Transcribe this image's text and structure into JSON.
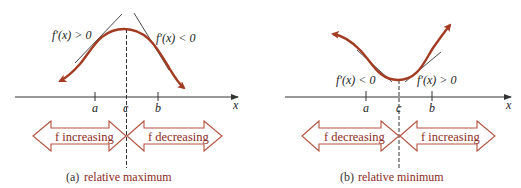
{
  "colors": {
    "curve": "#a33b22",
    "arrow_outline": "#b5523f",
    "text_accent": "#8b2a1e",
    "axis": "#333333",
    "tangent": "#333333"
  },
  "panels": [
    {
      "id": "a",
      "derivative_left": "f′(x) > 0",
      "derivative_right": "f′(x) < 0",
      "ticks": {
        "a": "a",
        "c": "c",
        "b": "b"
      },
      "axis_label": "x",
      "arrow_left": "f increasing",
      "arrow_right": "f decreasing",
      "caption_tag": "(a)",
      "caption_text": "relative maximum"
    },
    {
      "id": "b",
      "derivative_left": "f′(x) < 0",
      "derivative_right": "f′(x) > 0",
      "ticks": {
        "a": "a",
        "c": "c",
        "b": "b"
      },
      "axis_label": "x",
      "arrow_left": "f decreasing",
      "arrow_right": "f increasing",
      "caption_tag": "(b)",
      "caption_text": "relative minimum"
    }
  ]
}
